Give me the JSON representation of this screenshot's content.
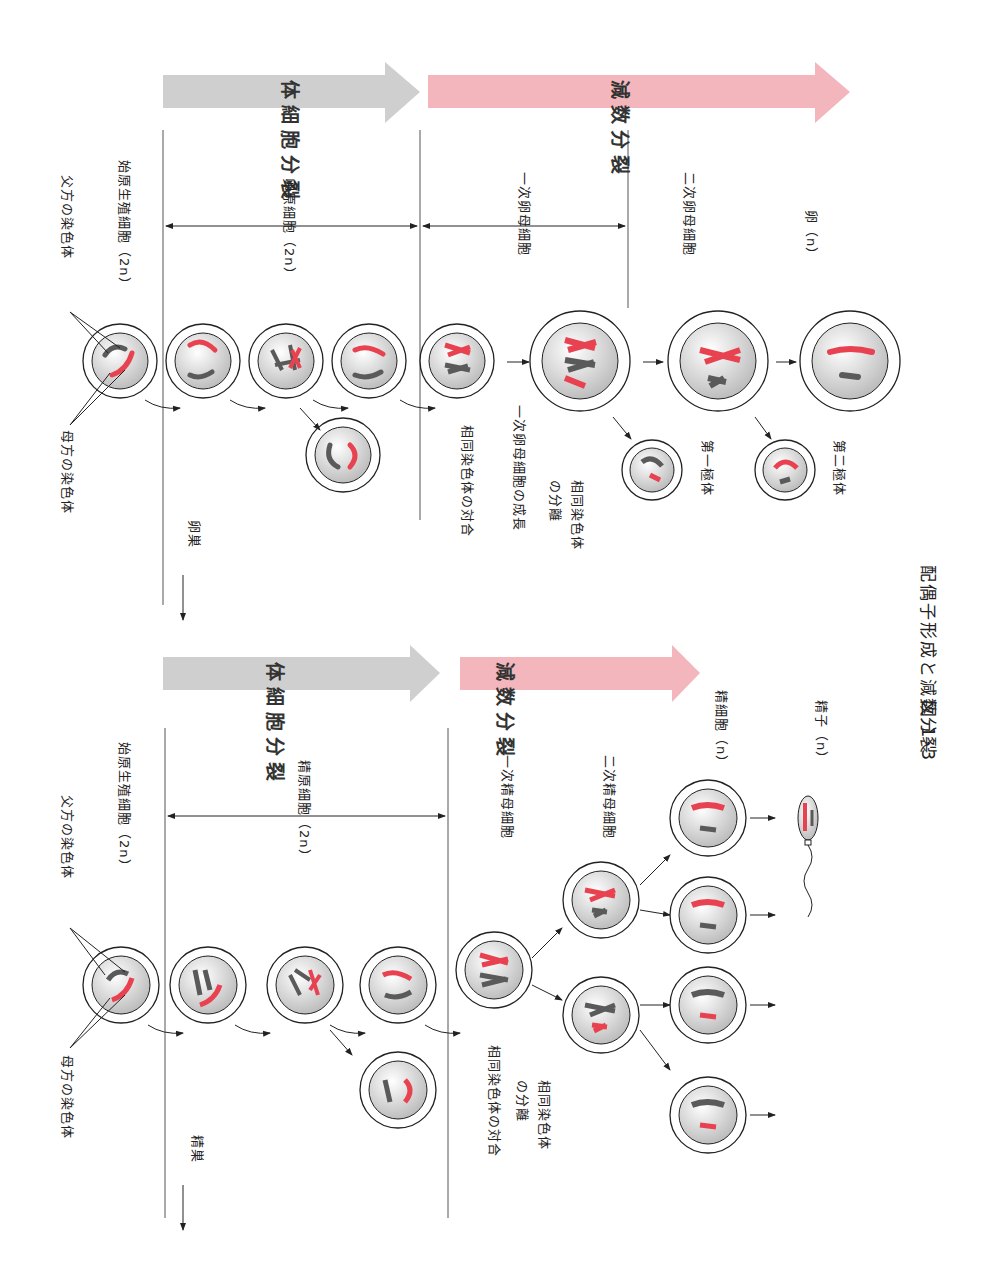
{
  "figure": {
    "number": "図 1･3",
    "caption": "配偶子形成と減数分裂"
  },
  "colors": {
    "mitosis_arrow": "#cfcfcf",
    "meiosis_arrow": "#f2b6bc",
    "maternal_chromosome": "#e8414f",
    "paternal_chromosome": "#5a5a5a",
    "line": "#555555"
  },
  "oogenesis": {
    "organ": "卵巣",
    "phase_mitosis": "体細胞分裂",
    "phase_meiosis": "減数分裂",
    "paternal_label": "父方の染色体",
    "maternal_label": "母方の染色体",
    "primordial": "始原生殖細胞（2n）",
    "oogonia": "卵原細胞（2n）",
    "primary": "一次卵母細胞",
    "secondary": "二次卵母細胞",
    "egg": "卵（n）",
    "synapsis": "相同染色体の対合",
    "growth": "一次卵母細胞の成長",
    "separation": "相同染色体\nの分離",
    "polar1": "第一極体",
    "polar2": "第二極体"
  },
  "spermatogenesis": {
    "organ": "精巣",
    "phase_mitosis": "体細胞分裂",
    "phase_meiosis": "減数分裂",
    "paternal_label": "父方の染色体",
    "maternal_label": "母方の染色体",
    "primordial": "始原生殖細胞（2n）",
    "spermatogonia": "精原細胞（2n）",
    "primary": "一次精母細胞",
    "secondary": "二次精母細胞",
    "spermatid": "精細胞（n）",
    "sperm": "精子（n）",
    "synapsis": "相同染色体の対合",
    "separation": "相同染色体\nの分離"
  }
}
